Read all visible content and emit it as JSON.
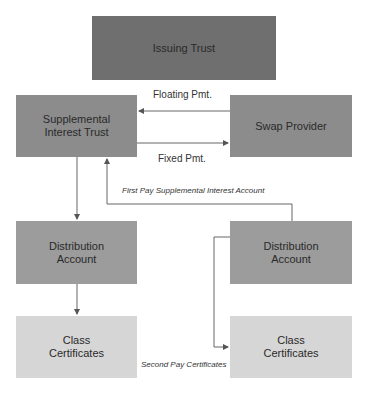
{
  "diagram": {
    "nodes": {
      "issuing_trust": "Issuing Trust",
      "supplemental_interest_trust": [
        "Supplemental",
        "Interest Trust"
      ],
      "swap_provider": "Swap Provider",
      "distribution_account_left": [
        "Distribution",
        "Account"
      ],
      "distribution_account_right": [
        "Distribution",
        "Account"
      ],
      "class_certificates_left": [
        "Class",
        "Certificates"
      ],
      "class_certificates_right": [
        "Class",
        "Certificates"
      ]
    },
    "edges": {
      "floating_pmt": "Floating Pmt.",
      "fixed_pmt": "Fixed Pmt.",
      "first_pay": "First Pay Supplemental Interest Account",
      "second_pay": "Second Pay Certificates"
    },
    "colors": {
      "issuing_trust": "#6f6f6f",
      "tier2": "#8c8c8c",
      "distribution": "#9c9c9c",
      "certificates": "#d6d6d6",
      "line": "#555555"
    }
  }
}
